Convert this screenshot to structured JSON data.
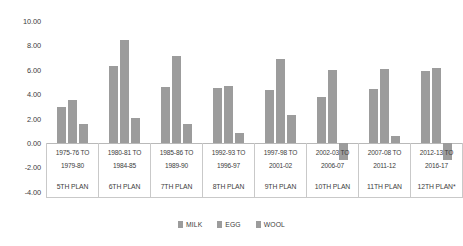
{
  "chart_data": {
    "type": "bar",
    "title": "",
    "xlabel": "",
    "ylabel": "",
    "ylim": [
      -4.0,
      10.0
    ],
    "ytick_step": 2.0,
    "ytick_labels": [
      "10.00",
      "8.00",
      "6.00",
      "4.00",
      "2.00",
      "0.00",
      "-2.00",
      "-4.00"
    ],
    "ytick_values": [
      10.0,
      8.0,
      6.0,
      4.0,
      2.0,
      0.0,
      -2.0,
      -4.0
    ],
    "grid": false,
    "legend_position": "bottom-center",
    "categories": [
      "1975-76 TO 1979-80",
      "1980-81 TO 1984-85",
      "1985-86 TO 1989-90",
      "1992-93 TO 1996-97",
      "1997-98 TO 2001-02",
      "2002-03 TO 2006-07",
      "2007-08 TO 2011-12",
      "2012-13 TO 2016-17"
    ],
    "category_lines": [
      [
        "1975-76 TO",
        "1979-80"
      ],
      [
        "1980-81 TO",
        "1984-85"
      ],
      [
        "1985-86 TO",
        "1989-90"
      ],
      [
        "1992-93 TO",
        "1996-97"
      ],
      [
        "1997-98 TO",
        "2001-02"
      ],
      [
        "2002-03 TO",
        "2006-07"
      ],
      [
        "2007-08 TO",
        "2011-12"
      ],
      [
        "2012-13 TO",
        "2016-17"
      ]
    ],
    "category_sublabels": [
      "5TH PLAN",
      "6TH PLAN",
      "7TH PLAN",
      "8TH PLAN",
      "9TH PLAN",
      "10TH PLAN",
      "11TH PLAN",
      "12TH PLAN*"
    ],
    "series": [
      {
        "name": "MILK",
        "color": "#9c9c9c",
        "values": [
          2.95,
          6.35,
          4.6,
          4.5,
          4.35,
          3.8,
          4.4,
          5.9
        ]
      },
      {
        "name": "EGG",
        "color": "#9c9c9c",
        "values": [
          3.55,
          8.45,
          7.15,
          4.65,
          6.9,
          5.95,
          6.05,
          6.15
        ]
      },
      {
        "name": "WOOL",
        "color": "#9c9c9c",
        "values": [
          1.55,
          2.05,
          1.55,
          0.8,
          2.3,
          -1.4,
          0.55,
          -1.4
        ]
      }
    ]
  },
  "legend": {
    "items": [
      {
        "label": "MILK",
        "color": "#9c9c9c"
      },
      {
        "label": "EGG",
        "color": "#9c9c9c"
      },
      {
        "label": "WOOL",
        "color": "#9c9c9c"
      }
    ]
  }
}
